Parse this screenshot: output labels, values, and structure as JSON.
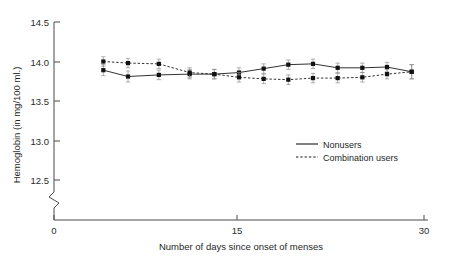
{
  "chart_data": {
    "type": "line",
    "title": "",
    "xlabel": "Number of days since onset of menses",
    "ylabel": "Hemoglobin (in mg/100 ml.)",
    "xlim": [
      0,
      30
    ],
    "ylim": [
      12.35,
      14.5
    ],
    "y_axis_break": true,
    "grid": false,
    "legend_position": "center-right",
    "x_ticks": [
      "0",
      "15",
      "30"
    ],
    "x_tick_values": [
      0,
      15,
      30
    ],
    "y_ticks": [
      "12.5",
      "13.0",
      "13.5",
      "14.0",
      "14.5"
    ],
    "y_tick_values": [
      12.5,
      13.0,
      13.5,
      14.0,
      14.5
    ],
    "x": [
      4,
      6,
      8.5,
      11,
      13,
      15,
      17,
      19,
      21,
      23,
      25,
      27,
      29
    ],
    "series": [
      {
        "name": "Nonusers",
        "style": "solid",
        "marker": "square",
        "values": [
          13.89,
          13.81,
          13.83,
          13.84,
          13.84,
          13.86,
          13.91,
          13.96,
          13.97,
          13.92,
          13.92,
          13.93,
          13.87
        ],
        "errors": [
          0.07,
          0.07,
          0.06,
          0.06,
          0.06,
          0.06,
          0.06,
          0.06,
          0.06,
          0.06,
          0.06,
          0.06,
          0.09
        ]
      },
      {
        "name": "Combination users",
        "style": "dotted",
        "marker": "square",
        "values": [
          14.0,
          13.98,
          13.97,
          13.86,
          13.84,
          13.8,
          13.78,
          13.77,
          13.79,
          13.79,
          13.8,
          13.84,
          13.87
        ],
        "errors": [
          0.06,
          0.06,
          0.06,
          0.06,
          0.06,
          0.06,
          0.06,
          0.06,
          0.06,
          0.06,
          0.06,
          0.06,
          0.09
        ]
      }
    ],
    "legend": [
      {
        "label": "Nonusers",
        "style": "solid"
      },
      {
        "label": "Combination users",
        "style": "dotted"
      }
    ]
  }
}
